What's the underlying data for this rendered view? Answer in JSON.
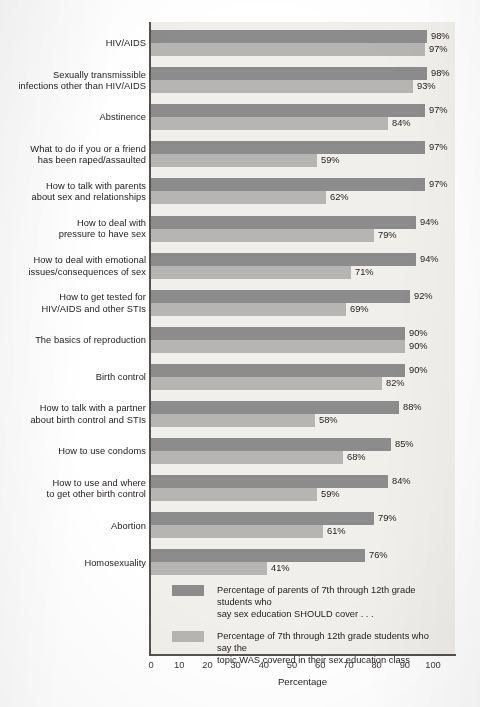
{
  "chart_data": {
    "type": "bar",
    "orientation": "horizontal",
    "title": "",
    "xlabel": "Percentage",
    "ylabel": "",
    "xlim": [
      0,
      100
    ],
    "xticks": [
      0,
      10,
      20,
      30,
      40,
      50,
      60,
      70,
      80,
      90,
      100
    ],
    "grid": false,
    "legend_position": "inside-bottom",
    "value_suffix": "%",
    "categories": [
      "HIV/AIDS",
      "Sexually transmissible infections other than HIV/AIDS",
      "Abstinence",
      "What to do if you or a friend has been raped/assaulted",
      "How to talk with parents about sex and relationships",
      "How to deal with pressure to have sex",
      "How to deal with emotional issues/consequences of sex",
      "How to get tested for HIV/AIDS and other STIs",
      "The basics of reproduction",
      "Birth control",
      "How to talk with a partner about birth control and STIs",
      "How to use condoms",
      "How to use and where to get other birth control",
      "Abortion",
      "Homosexuality"
    ],
    "category_lines": [
      [
        "HIV/AIDS"
      ],
      [
        "Sexually transmissible",
        "infections other than HIV/AIDS"
      ],
      [
        "Abstinence"
      ],
      [
        "What to do if you or a friend",
        "has been raped/assaulted"
      ],
      [
        "How to talk with parents",
        "about sex and relationships"
      ],
      [
        "How to deal with",
        "pressure to have sex"
      ],
      [
        "How to deal with emotional",
        "issues/consequences of sex"
      ],
      [
        "How to get tested for",
        "HIV/AIDS and other STIs"
      ],
      [
        "The basics of reproduction"
      ],
      [
        "Birth control"
      ],
      [
        "How to talk with a partner",
        "about birth control and STIs"
      ],
      [
        "How to use condoms"
      ],
      [
        "How to use and where",
        "to get other birth control"
      ],
      [
        "Abortion"
      ],
      [
        "Homosexuality"
      ]
    ],
    "series": [
      {
        "name": "Percentage of parents of 7th through 12th grade students who say sex education SHOULD cover . . .",
        "key": "should",
        "color": "#8d8c8c",
        "values": [
          98,
          98,
          97,
          97,
          97,
          94,
          94,
          92,
          90,
          90,
          88,
          85,
          84,
          79,
          76
        ],
        "labels": [
          "98%",
          "98%",
          "97%",
          "97%",
          "97%",
          "94%",
          "94%",
          "92%",
          "90%",
          "90%",
          "88%",
          "85%",
          "84%",
          "79%",
          "76%"
        ]
      },
      {
        "name": "Percentage of 7th through 12th grade students who say the topic WAS covered in their sex education class",
        "key": "covered",
        "color": "#b6b5b4",
        "values": [
          97,
          93,
          84,
          59,
          62,
          79,
          71,
          69,
          90,
          82,
          58,
          68,
          59,
          61,
          41
        ],
        "labels": [
          "97%",
          "93%",
          "84%",
          "59%",
          "62%",
          "79%",
          "71%",
          "69%",
          "90%",
          "82%",
          "58%",
          "68%",
          "59%",
          "61%",
          "41%"
        ]
      }
    ]
  },
  "legend": {
    "items": [
      {
        "key": "should",
        "color": "#8d8c8c",
        "lines": [
          "Percentage of parents of 7th through 12th grade students who",
          "say sex education SHOULD cover . . ."
        ]
      },
      {
        "key": "covered",
        "color": "#b6b5b4",
        "lines": [
          "Percentage of 7th through 12th grade students who say the",
          "topic WAS covered in their sex education class"
        ]
      }
    ]
  },
  "axis": {
    "x_title": "Percentage",
    "x_tick_labels": [
      "0",
      "10",
      "20",
      "30",
      "40",
      "50",
      "60",
      "70",
      "80",
      "90",
      "100"
    ]
  },
  "colors": {
    "series_should": "#8d8c8c",
    "series_covered": "#b6b5b4",
    "plot_background": "#f1efec",
    "axis_line": "#55514e",
    "text": "#25211f"
  }
}
